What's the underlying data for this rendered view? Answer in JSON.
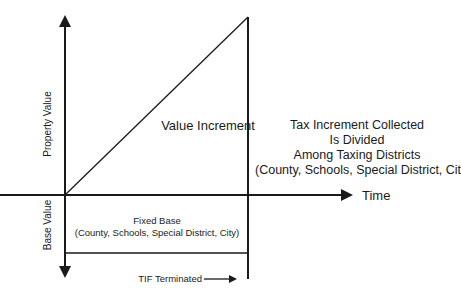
{
  "diagram": {
    "title": "",
    "y_axis_up_label": "Property Value",
    "y_axis_down_label": "Base Value",
    "x_axis_label": "Time",
    "increment_label": "Value Increment",
    "tax_text": {
      "line1": "Tax Increment Collected",
      "line2": "Is Divided",
      "line3": "Among Taxing Districts",
      "line4": "(County, Schools, Special District, City)"
    },
    "fixed_base": {
      "line1": "Fixed Base",
      "line2": "(County, Schools, Special District, City)"
    },
    "tif_label": "TIF Terminated",
    "colors": {
      "line": "#1a1a1a",
      "background": "#ffffff"
    }
  }
}
